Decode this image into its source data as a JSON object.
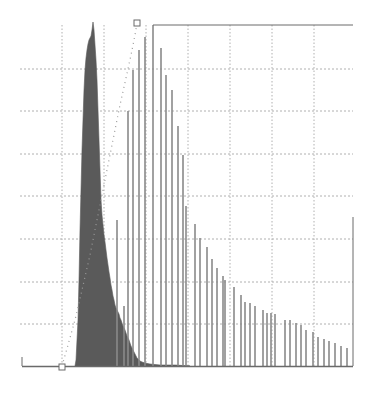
{
  "chart_data": {
    "type": "bar",
    "title": "",
    "xlabel": "",
    "ylabel": "",
    "grid": true,
    "legend": "none",
    "colors": {
      "filled_histogram": "#5a5a5a",
      "line_bars": "#8a8a8a",
      "grid": "#b0b0b0",
      "axis": "#6a6a6a",
      "cumulative_dots": "#9a9a9a"
    },
    "plot_px": {
      "left": 20,
      "right": 353,
      "top": 25,
      "baseline": 366
    },
    "grid_px": {
      "vertical": [
        62,
        104,
        146,
        188,
        230,
        272,
        314
      ],
      "horizontal": [
        69,
        111,
        154,
        196,
        239,
        282,
        324
      ]
    },
    "series": [
      {
        "name": "filled-histogram",
        "style": "filled-steps",
        "points_px": [
          [
            75,
            366
          ],
          [
            76,
            360
          ],
          [
            77,
            340
          ],
          [
            78,
            320
          ],
          [
            79,
            280
          ],
          [
            80,
            230
          ],
          [
            81,
            190
          ],
          [
            82,
            150
          ],
          [
            83,
            120
          ],
          [
            84,
            90
          ],
          [
            85,
            70
          ],
          [
            86,
            58
          ],
          [
            87,
            50
          ],
          [
            88,
            44
          ],
          [
            89,
            40
          ],
          [
            90,
            38
          ],
          [
            91,
            36
          ],
          [
            92,
            30
          ],
          [
            93,
            22
          ],
          [
            94,
            30
          ],
          [
            95,
            45
          ],
          [
            96,
            60
          ],
          [
            97,
            80
          ],
          [
            98,
            110
          ],
          [
            99,
            140
          ],
          [
            100,
            170
          ],
          [
            101,
            200
          ],
          [
            102,
            215
          ],
          [
            103,
            225
          ],
          [
            104,
            235
          ],
          [
            105,
            242
          ],
          [
            106,
            250
          ],
          [
            107,
            258
          ],
          [
            108,
            265
          ],
          [
            109,
            272
          ],
          [
            110,
            278
          ],
          [
            111,
            285
          ],
          [
            112,
            290
          ],
          [
            113,
            296
          ],
          [
            114,
            300
          ],
          [
            115,
            305
          ],
          [
            116,
            308
          ],
          [
            117,
            310
          ],
          [
            118,
            312
          ],
          [
            119,
            314
          ],
          [
            120,
            318
          ],
          [
            121,
            320
          ],
          [
            122,
            323
          ],
          [
            123,
            326
          ],
          [
            124,
            328
          ],
          [
            125,
            330
          ],
          [
            126,
            333
          ],
          [
            127,
            336
          ],
          [
            128,
            338
          ],
          [
            129,
            340
          ],
          [
            130,
            343
          ],
          [
            131,
            346
          ],
          [
            132,
            348
          ],
          [
            133,
            350
          ],
          [
            134,
            352
          ],
          [
            135,
            354
          ],
          [
            136,
            356
          ],
          [
            137,
            358
          ],
          [
            138,
            359
          ],
          [
            139,
            360
          ],
          [
            140,
            361
          ],
          [
            142,
            362
          ],
          [
            145,
            363
          ],
          [
            150,
            364
          ],
          [
            160,
            365
          ],
          [
            175,
            365
          ],
          [
            190,
            366
          ]
        ]
      },
      {
        "name": "line-bars",
        "style": "vertical-lines",
        "bars_px": [
          [
            117,
            220
          ],
          [
            124,
            306
          ],
          [
            128,
            111
          ],
          [
            133,
            70
          ],
          [
            139,
            50
          ],
          [
            145,
            37
          ],
          [
            153,
            25
          ],
          [
            161,
            48
          ],
          [
            166,
            75
          ],
          [
            172,
            90
          ],
          [
            178,
            126
          ],
          [
            183,
            155
          ],
          [
            186,
            206
          ],
          [
            195,
            224
          ],
          [
            200,
            238
          ],
          [
            207,
            247
          ],
          [
            212,
            259
          ],
          [
            217,
            268
          ],
          [
            223,
            276
          ],
          [
            225,
            280
          ],
          [
            234,
            287
          ],
          [
            241,
            295
          ],
          [
            245,
            302
          ],
          [
            250,
            303
          ],
          [
            255,
            306
          ],
          [
            263,
            310
          ],
          [
            267,
            313
          ],
          [
            271,
            313
          ],
          [
            275,
            314
          ],
          [
            285,
            320
          ],
          [
            290,
            320
          ],
          [
            296,
            323
          ],
          [
            301,
            325
          ],
          [
            306,
            330
          ],
          [
            313,
            332
          ],
          [
            318,
            337
          ],
          [
            324,
            339
          ],
          [
            329,
            341
          ],
          [
            335,
            343
          ],
          [
            341,
            346
          ],
          [
            347,
            348
          ]
        ]
      },
      {
        "name": "cumulative-curve",
        "style": "dotted",
        "points_px": [
          [
            62,
            366
          ],
          [
            68,
            345
          ],
          [
            75,
            320
          ],
          [
            82,
            290
          ],
          [
            90,
            255
          ],
          [
            98,
            215
          ],
          [
            106,
            175
          ],
          [
            114,
            135
          ],
          [
            120,
            105
          ],
          [
            126,
            78
          ],
          [
            131,
            55
          ],
          [
            135,
            35
          ],
          [
            137,
            23
          ]
        ]
      }
    ],
    "markers": [
      {
        "name": "start-marker",
        "shape": "square",
        "x": 62,
        "y": 367
      },
      {
        "name": "end-marker",
        "shape": "square",
        "x": 137,
        "y": 23
      }
    ],
    "reference_lines": [
      {
        "name": "top-line",
        "x1": 153,
        "y1": 25,
        "x2": 353,
        "y2": 25
      },
      {
        "name": "right-line",
        "x1": 353,
        "y1": 217,
        "x2": 353,
        "y2": 366
      },
      {
        "name": "left-tick",
        "x1": 22,
        "y1": 357,
        "x2": 22,
        "y2": 366
      }
    ]
  }
}
